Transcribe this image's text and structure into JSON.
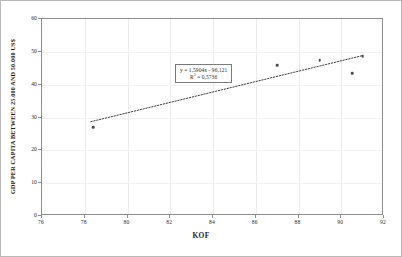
{
  "chart_data": {
    "type": "scatter",
    "title": "",
    "xlabel": "KOF",
    "ylabel": "GDP PER CAPITA BETWEEN 25.000 AND 50.000 US$",
    "xlim": [
      76,
      92
    ],
    "ylim": [
      0,
      60
    ],
    "xticks": [
      "76",
      "78",
      "80",
      "82",
      "84",
      "86",
      "88",
      "90",
      "92"
    ],
    "yticks": [
      "0",
      "10",
      "20",
      "30",
      "40",
      "50",
      "60"
    ],
    "grid": true,
    "legend": "none",
    "series": [
      {
        "name": "GDP per capita vs KOF",
        "marker": "filled-circle",
        "color": "#4a4a58",
        "points": [
          {
            "x": 78.4,
            "y": 27.0
          },
          {
            "x": 87.0,
            "y": 46.0
          },
          {
            "x": 89.0,
            "y": 47.5
          },
          {
            "x": 90.5,
            "y": 43.5
          },
          {
            "x": 91.0,
            "y": 48.7
          }
        ]
      }
    ],
    "trendline": {
      "type": "linear-dotted",
      "color": "#3a3a3a",
      "slope": 1.5904,
      "intercept": -96.121,
      "r_squared": 0.5736,
      "x_start": 78.3,
      "x_end": 91.1
    },
    "annotations": {
      "equation_line1": "y = 1,5904x - 96,121",
      "equation_r2_prefix": "R",
      "equation_r2_sup": "2",
      "equation_r2_value": " = 0,5736"
    }
  }
}
